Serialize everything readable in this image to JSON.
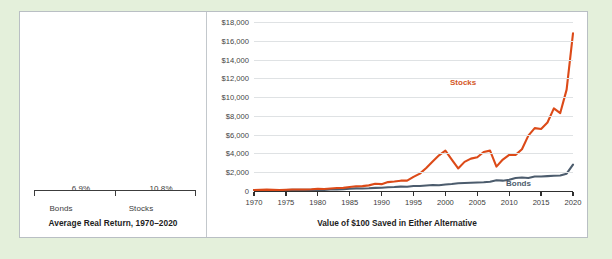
{
  "figure": {
    "background_color": "#e4f0db",
    "panel_color": "#ffffff",
    "border_color": "#b9bfc4"
  },
  "colors": {
    "bonds": "#4c5c6d",
    "stocks": "#dc4a18",
    "stocks_label": "#d4571f",
    "gridline": "#dfe2e4",
    "axis": "#2f2f2f"
  },
  "chart_data": [
    {
      "type": "bar",
      "title": "",
      "xlabel": "Average Real Return, 1970–2020",
      "ylabel": "",
      "categories": [
        "Bonds",
        "Stocks"
      ],
      "values": [
        6.9,
        10.8
      ],
      "value_labels": [
        "6.9%",
        "10.8%"
      ],
      "ylim": [
        0,
        12.2
      ],
      "grid": false,
      "legend": "none",
      "series_colors": [
        "#4c5c6d",
        "#dc4a18"
      ]
    },
    {
      "type": "line",
      "title": "",
      "xlabel": "Value of $100 Saved in Either Alternative",
      "ylabel": "",
      "xlim": [
        1970,
        2020
      ],
      "ylim": [
        0,
        18000
      ],
      "grid": true,
      "legend": "inline-labels",
      "ytick_labels": [
        "0",
        "$2,000",
        "$4,000",
        "$6,000",
        "$8,000",
        "$10,000",
        "$12,000",
        "$14,000",
        "$16,000",
        "$18,000"
      ],
      "ytick_values": [
        0,
        2000,
        4000,
        6000,
        8000,
        10000,
        12000,
        14000,
        16000,
        18000
      ],
      "xtick_labels": [
        "1970",
        "1975",
        "1980",
        "1985",
        "1990",
        "1995",
        "2000",
        "2005",
        "2010",
        "2015",
        "2020"
      ],
      "xtick_values": [
        1970,
        1975,
        1980,
        1985,
        1990,
        1995,
        2000,
        2005,
        2010,
        2015,
        2020
      ],
      "x": [
        1970,
        1971,
        1972,
        1973,
        1974,
        1975,
        1976,
        1977,
        1978,
        1979,
        1980,
        1981,
        1982,
        1983,
        1984,
        1985,
        1986,
        1987,
        1988,
        1989,
        1990,
        1991,
        1992,
        1993,
        1994,
        1995,
        1996,
        1997,
        1998,
        1999,
        2000,
        2001,
        2002,
        2003,
        2004,
        2005,
        2006,
        2007,
        2008,
        2009,
        2010,
        2011,
        2012,
        2013,
        2014,
        2015,
        2016,
        2017,
        2018,
        2019,
        2020
      ],
      "series": [
        {
          "name": "Stocks",
          "color": "#dc4a18",
          "values": [
            100,
            110,
            125,
            110,
            84,
            110,
            132,
            126,
            130,
            148,
            185,
            175,
            205,
            245,
            250,
            320,
            370,
            380,
            430,
            550,
            520,
            660,
            700,
            760,
            760,
            1020,
            1230,
            1600,
            2020,
            2400,
            2240,
            1950,
            1520,
            1940,
            2120,
            2180,
            2480,
            2560,
            1620,
            2020,
            2280,
            2280,
            2600,
            3380,
            3780,
            3720,
            4100,
            4900,
            4640,
            5980,
            7000
          ],
          "values_scaled_note": "Rendered series reaches $16,800 at 2020",
          "rendered_values": [
            100,
            120,
            150,
            120,
            90,
            130,
            165,
            155,
            160,
            185,
            230,
            215,
            265,
            320,
            330,
            430,
            510,
            520,
            600,
            780,
            730,
            950,
            1010,
            1100,
            1100,
            1500,
            1850,
            2450,
            3150,
            3800,
            4300,
            3350,
            2400,
            3100,
            3450,
            3600,
            4150,
            4300,
            2600,
            3350,
            3850,
            3850,
            4450,
            5900,
            6700,
            6600,
            7300,
            8800,
            8300,
            10800,
            16800
          ],
          "endpoint_value": 16800
        },
        {
          "name": "Bonds",
          "color": "#4c5c6d",
          "rendered_values": [
            100,
            103,
            107,
            105,
            103,
            106,
            118,
            120,
            118,
            115,
            112,
            118,
            160,
            170,
            195,
            235,
            275,
            270,
            290,
            330,
            345,
            395,
            420,
            470,
            450,
            530,
            535,
            585,
            640,
            620,
            690,
            740,
            820,
            850,
            880,
            900,
            930,
            980,
            1140,
            1100,
            1190,
            1380,
            1430,
            1380,
            1540,
            1540,
            1580,
            1630,
            1650,
            1840,
            2800
          ],
          "endpoint_value": 2800
        }
      ]
    }
  ],
  "labels": {
    "bar_caption": "Average Real Return, 1970–2020",
    "line_caption": "Value of $100 Saved in Either Alternative",
    "stocks_series": "Stocks",
    "bonds_series": "Bonds",
    "bar_bonds_tick": "Bonds",
    "bar_stocks_tick": "Stocks",
    "bar_bonds_value": "6.9%",
    "bar_stocks_value": "10.8%"
  }
}
